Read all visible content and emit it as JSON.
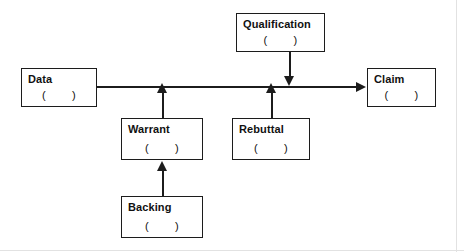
{
  "diagram": {
    "type": "toulmin-argument-model",
    "slot_text": "(        )",
    "line_color": "#1c1c1c",
    "background_color": "#ffffff",
    "nodes": [
      {
        "id": "data",
        "label": "Data",
        "slot": "(        )"
      },
      {
        "id": "claim",
        "label": "Claim",
        "slot": "(        )"
      },
      {
        "id": "qualification",
        "label": "Qualification",
        "slot": "(        )"
      },
      {
        "id": "warrant",
        "label": "Warrant",
        "slot": "(        )"
      },
      {
        "id": "rebuttal",
        "label": "Rebuttal",
        "slot": "(        )"
      },
      {
        "id": "backing",
        "label": "Backing",
        "slot": "(        )"
      }
    ],
    "connectors": [
      {
        "id": "data-to-claim",
        "from": "data",
        "to": "claim",
        "direction": "right"
      },
      {
        "id": "warrant-to-main",
        "from": "warrant",
        "to": "data-to-claim",
        "direction": "up"
      },
      {
        "id": "rebuttal-to-main",
        "from": "rebuttal",
        "to": "data-to-claim",
        "direction": "up"
      },
      {
        "id": "qualification-to-main",
        "from": "qualification",
        "to": "data-to-claim",
        "direction": "down"
      },
      {
        "id": "backing-to-warrant",
        "from": "backing",
        "to": "warrant",
        "direction": "up"
      }
    ]
  }
}
